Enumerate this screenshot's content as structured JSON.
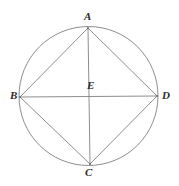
{
  "figure": {
    "type": "geometry-diagram",
    "canvas": {
      "width": 179,
      "height": 186
    },
    "background_color": "#ffffff",
    "stroke_color": "#808080",
    "label_color": "#2b2b2b",
    "stroke_width": 0.9,
    "circle": {
      "cx": 88.5,
      "cy": 96,
      "r": 69.5
    },
    "points": [
      {
        "id": "A",
        "label": "A",
        "x": 88,
        "y": 28,
        "label_x": 84,
        "label_y": 11
      },
      {
        "id": "B",
        "label": "B",
        "x": 20,
        "y": 97,
        "label_x": 10,
        "label_y": 90
      },
      {
        "id": "C",
        "label": "C",
        "x": 90,
        "y": 164,
        "label_x": 85,
        "label_y": 167
      },
      {
        "id": "D",
        "label": "D",
        "x": 157,
        "y": 96,
        "label_x": 162,
        "label_y": 90
      },
      {
        "id": "E",
        "label": "E",
        "x": 89,
        "y": 96,
        "label_x": 87,
        "label_y": 80
      }
    ],
    "segments": [
      {
        "id": "AB",
        "from": "A",
        "to": "B"
      },
      {
        "id": "AD",
        "from": "A",
        "to": "D"
      },
      {
        "id": "BC",
        "from": "B",
        "to": "C"
      },
      {
        "id": "CD",
        "from": "C",
        "to": "D"
      },
      {
        "id": "AC",
        "from": "A",
        "to": "C"
      },
      {
        "id": "BD",
        "from": "B",
        "to": "D"
      }
    ]
  }
}
